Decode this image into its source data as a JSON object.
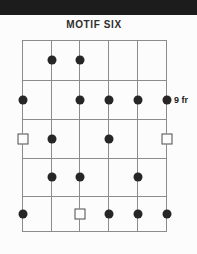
{
  "title": "MOTIF SIX",
  "fret_label": "9 fr",
  "colors": {
    "header_bar": "#1c1c1c",
    "title_text": "#2e2e2e",
    "grid_line": "#8c8c8c",
    "dot_fill": "#262626",
    "square_border": "#4a4a4a",
    "background": "#fcfcfc"
  },
  "diagram": {
    "type": "guitar-fretboard",
    "string_count": 6,
    "fret_count": 5,
    "position_label": "9 fr",
    "position_label_row": 2,
    "strings_x": [
      22,
      51,
      79,
      108,
      137,
      166
    ],
    "frets_y": [
      40,
      80,
      119,
      158,
      196,
      231
    ],
    "rows_y": [
      60,
      100,
      139,
      177,
      214
    ],
    "markers": [
      {
        "row": 1,
        "string": 2,
        "type": "dot"
      },
      {
        "row": 1,
        "string": 3,
        "type": "dot"
      },
      {
        "row": 2,
        "string": 1,
        "type": "dot"
      },
      {
        "row": 2,
        "string": 3,
        "type": "dot"
      },
      {
        "row": 2,
        "string": 4,
        "type": "dot"
      },
      {
        "row": 2,
        "string": 5,
        "type": "dot"
      },
      {
        "row": 2,
        "string": 6,
        "type": "dot"
      },
      {
        "row": 3,
        "string": 1,
        "type": "square"
      },
      {
        "row": 3,
        "string": 2,
        "type": "dot"
      },
      {
        "row": 3,
        "string": 4,
        "type": "dot"
      },
      {
        "row": 3,
        "string": 6,
        "type": "square"
      },
      {
        "row": 4,
        "string": 2,
        "type": "dot"
      },
      {
        "row": 4,
        "string": 3,
        "type": "dot"
      },
      {
        "row": 4,
        "string": 5,
        "type": "dot"
      },
      {
        "row": 5,
        "string": 1,
        "type": "dot"
      },
      {
        "row": 5,
        "string": 3,
        "type": "square"
      },
      {
        "row": 5,
        "string": 4,
        "type": "dot"
      },
      {
        "row": 5,
        "string": 5,
        "type": "dot"
      },
      {
        "row": 5,
        "string": 6,
        "type": "dot"
      }
    ]
  }
}
